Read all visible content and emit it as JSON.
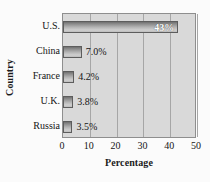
{
  "chart_data": {
    "type": "bar",
    "orientation": "horizontal",
    "title": "",
    "xlabel": "Percentage",
    "ylabel": "Country",
    "categories": [
      "U.S.",
      "China",
      "France",
      "U.K.",
      "Russia"
    ],
    "values": [
      43,
      7.0,
      4.2,
      3.8,
      3.5
    ],
    "data_labels": [
      "43%",
      "7.0%",
      "4.2%",
      "3.8%",
      "3.5%"
    ],
    "label_position": [
      "inside",
      "outside",
      "outside",
      "outside",
      "outside"
    ],
    "xlim": [
      0,
      50
    ],
    "xticks": [
      0,
      10,
      20,
      30,
      40,
      50
    ],
    "xtick_labels": [
      "0",
      "10",
      "20",
      "30",
      "40",
      "50"
    ],
    "grid": "vertical",
    "legend": "none",
    "colors": {
      "plot_background": "#d9d9d9",
      "figure_background": "#fbfbfb",
      "bar_dark": "#6f6f6f",
      "bar_light": "#cfcfcf",
      "gridline": "#a6a6a6",
      "axis_border": "#8e8e8e",
      "text": "#151515",
      "inside_label_text": "#ffffff"
    }
  }
}
